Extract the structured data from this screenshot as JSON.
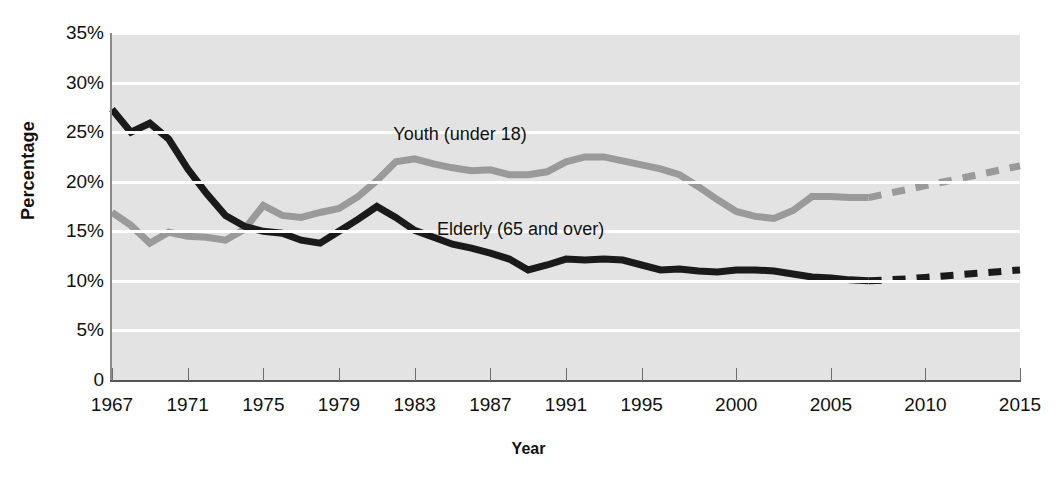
{
  "chart_data": {
    "type": "line",
    "title": "",
    "xlabel": "Year",
    "ylabel": "Percentage",
    "xlim": [
      1967,
      2015
    ],
    "ylim": [
      0,
      35
    ],
    "grid": true,
    "legend_position": "inline-annotation",
    "xtick_labels": [
      "1967",
      "1971",
      "1975",
      "1979",
      "1983",
      "1987",
      "1991",
      "1995",
      "2000",
      "2005",
      "2010",
      "2015"
    ],
    "xtick_values": [
      1967,
      1971,
      1975,
      1979,
      1983,
      1987,
      1991,
      1995,
      2000,
      2005,
      2010,
      2015
    ],
    "ytick_labels": [
      "0",
      "5%",
      "10%",
      "15%",
      "20%",
      "25%",
      "30%",
      "35%"
    ],
    "ytick_values": [
      0,
      5,
      10,
      15,
      20,
      25,
      30,
      35
    ],
    "series": [
      {
        "name": "Youth (under 18)",
        "color": "#9a9a9a",
        "label_x": 1985.4,
        "label_y": 24.6,
        "solid_x": [
          1967,
          1968,
          1969,
          1970,
          1971,
          1972,
          1973,
          1974,
          1975,
          1976,
          1977,
          1978,
          1979,
          1980,
          1981,
          1982,
          1983,
          1984,
          1985,
          1986,
          1987,
          1988,
          1989,
          1990,
          1991,
          1992,
          1993,
          1994,
          1995,
          1996,
          1997,
          1998,
          1999,
          2000,
          2001,
          2002,
          2003,
          2004,
          2005,
          2006,
          2007
        ],
        "solid_values": [
          16.9,
          15.6,
          13.8,
          14.9,
          14.5,
          14.4,
          14.1,
          15.2,
          17.6,
          16.6,
          16.4,
          16.9,
          17.3,
          18.5,
          20.1,
          22.0,
          22.3,
          21.8,
          21.4,
          21.1,
          21.2,
          20.7,
          20.7,
          21.0,
          22.0,
          22.5,
          22.5,
          22.1,
          21.7,
          21.3,
          20.7,
          19.5,
          18.2,
          17.0,
          16.5,
          16.3,
          17.1,
          18.5,
          18.5,
          18.4,
          18.4
        ],
        "dashed_x": [
          2007,
          2008,
          2009,
          2010,
          2011,
          2012,
          2013,
          2014,
          2015
        ],
        "dashed_values": [
          18.4,
          18.8,
          19.2,
          19.6,
          20.0,
          20.4,
          20.8,
          21.2,
          21.6
        ]
      },
      {
        "name": "Elderly (65 and over)",
        "color": "#1a1a1a",
        "label_x": 1988.6,
        "label_y": 15.0,
        "solid_x": [
          1967,
          1968,
          1969,
          1970,
          1971,
          1972,
          1973,
          1974,
          1975,
          1976,
          1977,
          1978,
          1979,
          1980,
          1981,
          1982,
          1983,
          1984,
          1985,
          1986,
          1987,
          1988,
          1989,
          1990,
          1991,
          1992,
          1993,
          1994,
          1995,
          1996,
          1997,
          1998,
          1999,
          2000,
          2001,
          2002,
          2003,
          2004,
          2005,
          2006,
          2007
        ],
        "solid_values": [
          27.3,
          25.0,
          25.9,
          24.3,
          21.3,
          18.8,
          16.6,
          15.5,
          15.0,
          14.8,
          14.1,
          13.8,
          15.0,
          16.2,
          17.5,
          16.4,
          15.1,
          14.4,
          13.7,
          13.3,
          12.8,
          12.2,
          11.1,
          11.6,
          12.2,
          12.1,
          12.2,
          12.1,
          11.6,
          11.1,
          11.2,
          11.0,
          10.9,
          11.1,
          11.1,
          11.0,
          10.7,
          10.4,
          10.3,
          10.1,
          10.0
        ],
        "dashed_x": [
          2007,
          2008,
          2009,
          2010,
          2011,
          2012,
          2013,
          2014,
          2015
        ],
        "dashed_values": [
          10.0,
          10.1,
          10.2,
          10.35,
          10.5,
          10.65,
          10.8,
          10.95,
          11.1
        ]
      }
    ]
  }
}
